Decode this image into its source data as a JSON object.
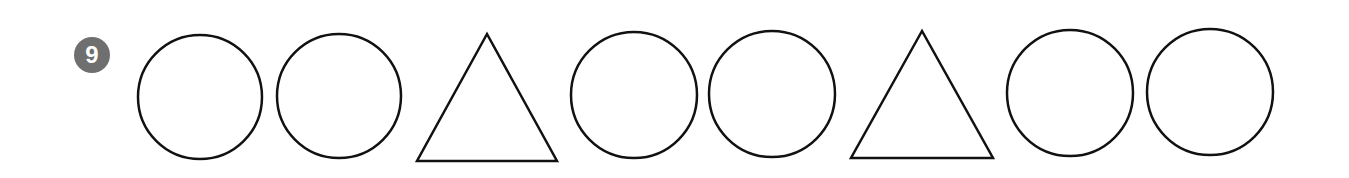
{
  "problem": {
    "number": "9",
    "badge_color": "#6f6f6f",
    "stroke_color": "#111111",
    "sequence": [
      {
        "shape": "circle",
        "cx": 200,
        "cy": 97,
        "r": 62
      },
      {
        "shape": "circle",
        "cx": 339,
        "cy": 96,
        "r": 62
      },
      {
        "shape": "triangle",
        "points": "487,34 417,161 557,161"
      },
      {
        "shape": "circle",
        "cx": 634,
        "cy": 95,
        "r": 63
      },
      {
        "shape": "circle",
        "cx": 772,
        "cy": 94,
        "r": 63
      },
      {
        "shape": "triangle",
        "points": "922,31 851,158 993,158"
      },
      {
        "shape": "circle",
        "cx": 1070,
        "cy": 93,
        "r": 63
      },
      {
        "shape": "circle",
        "cx": 1210,
        "cy": 92,
        "r": 63
      }
    ]
  }
}
